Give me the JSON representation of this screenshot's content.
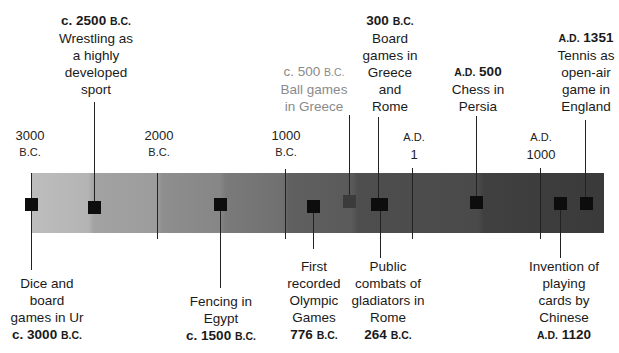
{
  "axis": {
    "ticks": [
      {
        "value": "3000",
        "era": "B.C.",
        "x": 31
      },
      {
        "value": "2000",
        "era": "B.C.",
        "x": 157
      },
      {
        "value": "1000",
        "era": "B.C.",
        "x": 285
      },
      {
        "value": "1",
        "era": "A.D.",
        "x": 412
      },
      {
        "value": "1000",
        "era": "A.D.",
        "x": 540
      }
    ]
  },
  "events_above": [
    {
      "date_prefix": "c. 2500",
      "date_suffix": "B.C.",
      "text": [
        "Wrestling as",
        "a highly",
        "developed",
        "sport"
      ]
    },
    {
      "date_prefix": "c. 500",
      "date_suffix": "B.C.",
      "text": [
        "Ball games",
        "in Greece"
      ],
      "style": "faint"
    },
    {
      "date_prefix": "300",
      "date_suffix": "B.C.",
      "text": [
        "Board",
        "games in",
        "Greece",
        "and",
        "Rome"
      ]
    },
    {
      "date_prefix": "A.D.",
      "date_suffix": "500",
      "text": [
        "Chess in",
        "Persia"
      ]
    },
    {
      "date_prefix": "A.D.",
      "date_suffix": "1351",
      "text": [
        "Tennis as",
        "open-air",
        "game in",
        "England"
      ]
    }
  ],
  "events_below": [
    {
      "text": [
        "Dice and",
        "board",
        "games in Ur"
      ],
      "date_prefix": "c. 3000",
      "date_suffix": "B.C."
    },
    {
      "text": [
        "Fencing in",
        "Egypt"
      ],
      "date_prefix": "c. 1500",
      "date_suffix": "B.C."
    },
    {
      "text": [
        "First",
        "recorded",
        "Olympic",
        "Games"
      ],
      "date_prefix": "776",
      "date_suffix": "B.C."
    },
    {
      "text": [
        "Public",
        "combats of",
        "gladiators in",
        "Rome"
      ],
      "date_prefix": "264",
      "date_suffix": "B.C."
    },
    {
      "text": [
        "Invention of",
        "playing",
        "cards by",
        "Chinese"
      ],
      "date_prefix": "A.D.",
      "date_suffix": "1120"
    }
  ],
  "colors": {
    "bar_light": "#bdbdbd",
    "bar_dark": "#3a3a3a",
    "marker": "#0d0d0d",
    "faint_text": "#8a8a8a"
  }
}
